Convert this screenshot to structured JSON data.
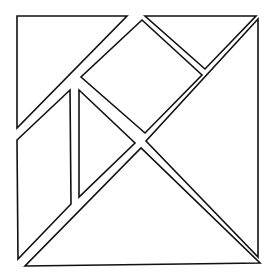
{
  "diagram": {
    "stroke_color": "#111111",
    "fill_color": "#ffffff",
    "pieces": [
      {
        "name": "large-triangle-top-left",
        "points": "17,16 127,16 17,128"
      },
      {
        "name": "small-triangle-top-right",
        "points": "145,16 256,16 205,69"
      },
      {
        "name": "square-center",
        "points": "142,20 202,75 145,133 81,77"
      },
      {
        "name": "large-triangle-right",
        "points": "258,19 258,257 146,141"
      },
      {
        "name": "parallelogram-left",
        "points": "17,140 70,90 71,204 18,259"
      },
      {
        "name": "small-triangle-middle",
        "points": "79,90 135,143 79,197"
      },
      {
        "name": "large-triangle-bottom",
        "points": "25,266 260,263 141,148"
      }
    ]
  }
}
